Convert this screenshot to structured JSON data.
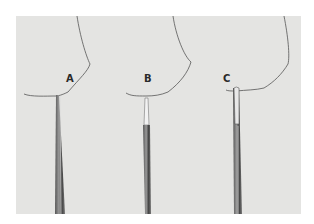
{
  "figure": {
    "panels": [
      {
        "label": "A",
        "label_x": 50,
        "label_y": 58
      },
      {
        "label": "B",
        "label_x": 128,
        "label_y": 58
      },
      {
        "label": "C",
        "label_x": 207,
        "label_y": 58
      }
    ]
  }
}
